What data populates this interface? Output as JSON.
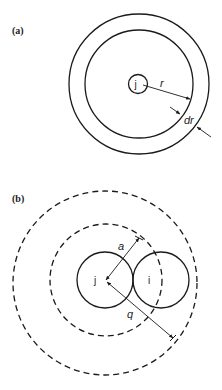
{
  "figure": {
    "panels": [
      {
        "id": "a",
        "label": "(a)",
        "center_label": "j",
        "radius_label": "r",
        "shell_label": "dr",
        "circles": [
          {
            "name": "particle-j",
            "style": "solid"
          },
          {
            "name": "inner-shell",
            "style": "solid"
          },
          {
            "name": "outer-shell",
            "style": "solid"
          }
        ]
      },
      {
        "id": "b",
        "label": "(b)",
        "particle_j_label": "j",
        "particle_i_label": "i",
        "radius_a_label": "a",
        "radius_q_label": "q",
        "circles": [
          {
            "name": "particle-j",
            "style": "solid"
          },
          {
            "name": "particle-i",
            "style": "solid"
          },
          {
            "name": "exclusion-radius-a",
            "style": "dashed"
          },
          {
            "name": "cutoff-radius-q",
            "style": "dashed"
          }
        ]
      }
    ],
    "colors": {
      "line": "#1a1a1a",
      "background": "#ffffff"
    }
  }
}
